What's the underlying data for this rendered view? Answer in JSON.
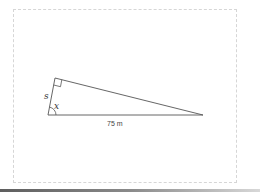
{
  "page": {
    "top_text_fragment": "below."
  },
  "diagram": {
    "type": "right-triangle",
    "labels": {
      "side_short": "s",
      "angle": "x",
      "base": "75 m"
    },
    "vertices": {
      "top_right_angle": [
        55,
        78
      ],
      "bottom_left_angle_x": [
        48,
        115
      ],
      "right": [
        203,
        115
      ]
    },
    "colors": {
      "stroke": "#555555",
      "frame_border": "#d6d6d6"
    }
  }
}
